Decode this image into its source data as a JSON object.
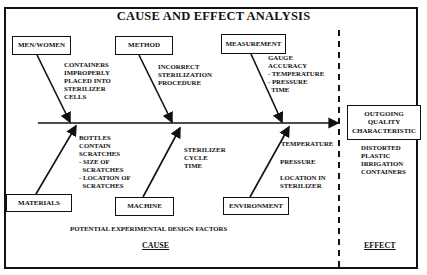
{
  "title": "CAUSE AND EFFECT ANALYSIS",
  "categories": {
    "men_women": {
      "label": "MEN/WOMEN",
      "causes": "CONTAINERS\nIMPROPERLY\nPLACED INTO\nSTERILIZER\nCELLS"
    },
    "method": {
      "label": "METHOD",
      "causes": "INCORRECT\nSTERILIZATION\nPROCEDURE"
    },
    "measurement": {
      "label": "MEASUREMENT",
      "causes": "GAUGE\nACCURACY\n- TEMPERATURE\n- PRESSURE\n  TIME"
    },
    "materials": {
      "label": "MATERIALS",
      "causes": "BOTTLES\nCONTAIN\nSCRATCHES\n- SIZE OF\n  SCRATCHES\n- LOCATION OF\n  SCRATCHES"
    },
    "machine": {
      "label": "MACHINE",
      "causes": "STERILIZER\nCYCLE\nTIME"
    },
    "environment": {
      "label": "ENVIRONMENT",
      "causes_1": "TEMPERATURE",
      "causes_2": "PRESSURE",
      "causes_3": "LOCATION IN\nSTERILIZER"
    }
  },
  "effect": {
    "box_label": "OUTGOING\nQUALITY\nCHARACTERISTIC",
    "description": "DISTORTED\nPLASTIC\nIRRIGATION\nCONTAINERS",
    "heading": "EFFECT"
  },
  "footer": {
    "factors_note": "POTENTIAL EXPERIMENTAL DESIGN FACTORS",
    "cause_heading": "CAUSE"
  }
}
